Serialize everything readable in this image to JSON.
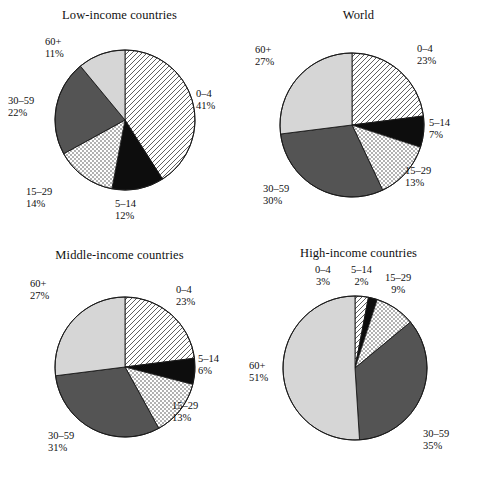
{
  "figure": {
    "background": "#ffffff",
    "panel_order": [
      "low",
      "world",
      "middle",
      "high"
    ]
  },
  "palette": {
    "hatch_stroke": "#4d4d4d",
    "hatch_bg": "#ffffff",
    "black": "#0d0d0d",
    "dotted_bg": "#ffffff",
    "dotted_dot": "#3d3d3d",
    "dark_gray": "#545454",
    "light_gray": "#d6d6d6",
    "outline": "#1a1a1a",
    "text": "#111111"
  },
  "categories": [
    "0–4",
    "5–14",
    "15–29",
    "30–59",
    "60+"
  ],
  "fills": [
    "hatch",
    "black",
    "dotted",
    "dark_gray",
    "light_gray"
  ],
  "chart_data": [
    {
      "type": "pie",
      "id": "low",
      "title": "Low-income countries",
      "categories": [
        "0–4",
        "5–14",
        "15–29",
        "30–59",
        "60+"
      ],
      "values": [
        41,
        12,
        14,
        22,
        11
      ],
      "labels": [
        "41%",
        "12%",
        "14%",
        "22%",
        "11%"
      ],
      "start_angle": 0,
      "direction": "clockwise",
      "center": [
        125,
        120
      ],
      "radius": 70
    },
    {
      "type": "pie",
      "id": "world",
      "title": "World",
      "categories": [
        "0–4",
        "5–14",
        "15–29",
        "30–59",
        "60+"
      ],
      "values": [
        23,
        7,
        13,
        30,
        27
      ],
      "labels": [
        "23%",
        "7%",
        "13%",
        "30%",
        "27%"
      ],
      "start_angle": 0,
      "direction": "clockwise",
      "center": [
        113,
        125
      ],
      "radius": 72
    },
    {
      "type": "pie",
      "id": "middle",
      "title": "Middle-income countries",
      "categories": [
        "0–4",
        "5–14",
        "15–29",
        "30–59",
        "60+"
      ],
      "values": [
        23,
        6,
        13,
        31,
        27
      ],
      "labels": [
        "23%",
        "6%",
        "13%",
        "31%",
        "27%"
      ],
      "start_angle": 0,
      "direction": "clockwise",
      "center": [
        125,
        127
      ],
      "radius": 70
    },
    {
      "type": "pie",
      "id": "high",
      "title": "High-income countries",
      "categories": [
        "0–4",
        "5–14",
        "15–29",
        "30–59",
        "60+"
      ],
      "values": [
        3,
        2,
        9,
        35,
        51
      ],
      "labels": [
        "3%",
        "2%",
        "9%",
        "35%",
        "51%"
      ],
      "start_angle": 0,
      "direction": "clockwise",
      "center": [
        116,
        128
      ],
      "radius": 72
    }
  ],
  "panels": {
    "low": {
      "title": "Low-income countries",
      "labels": [
        {
          "range": "0–4",
          "pct": "41%",
          "x": 196,
          "y": 88,
          "align": "left"
        },
        {
          "range": "5–14",
          "pct": "12%",
          "x": 115,
          "y": 198,
          "align": "left"
        },
        {
          "range": "15–29",
          "pct": "14%",
          "x": 26,
          "y": 186,
          "align": "left"
        },
        {
          "range": "30–59",
          "pct": "22%",
          "x": 8,
          "y": 95,
          "align": "left"
        },
        {
          "range": "60+",
          "pct": "11%",
          "x": 45,
          "y": 36,
          "align": "left"
        }
      ]
    },
    "world": {
      "title": "World",
      "labels": [
        {
          "range": "0–4",
          "pct": "23%",
          "x": 178,
          "y": 43,
          "align": "left"
        },
        {
          "range": "5–14",
          "pct": "7%",
          "x": 190,
          "y": 117,
          "align": "left"
        },
        {
          "range": "15–29",
          "pct": "13%",
          "x": 166,
          "y": 165,
          "align": "left"
        },
        {
          "range": "30–59",
          "pct": "30%",
          "x": 24,
          "y": 183,
          "align": "left"
        },
        {
          "range": "60+",
          "pct": "27%",
          "x": 16,
          "y": 44,
          "align": "left"
        }
      ]
    },
    "middle": {
      "title": "Middle-income countries",
      "labels": [
        {
          "range": "0–4",
          "pct": "23%",
          "x": 176,
          "y": 44,
          "align": "left"
        },
        {
          "range": "5–14",
          "pct": "6%",
          "x": 198,
          "y": 113,
          "align": "left"
        },
        {
          "range": "15–29",
          "pct": "13%",
          "x": 172,
          "y": 160,
          "align": "left"
        },
        {
          "range": "30–59",
          "pct": "31%",
          "x": 48,
          "y": 190,
          "align": "left"
        },
        {
          "range": "60+",
          "pct": "27%",
          "x": 30,
          "y": 38,
          "align": "left"
        }
      ]
    },
    "high": {
      "title": "High-income countries",
      "labels": [
        {
          "range": "0–4",
          "pct": "3%",
          "x": 76,
          "y": 24,
          "align": "center"
        },
        {
          "range": "5–14",
          "pct": "2%",
          "x": 112,
          "y": 24,
          "align": "center"
        },
        {
          "range": "15–29",
          "pct": "9%",
          "x": 146,
          "y": 32,
          "align": "center"
        },
        {
          "range": "30–59",
          "pct": "35%",
          "x": 184,
          "y": 188,
          "align": "left"
        },
        {
          "range": "60+",
          "pct": "51%",
          "x": 10,
          "y": 120,
          "align": "left"
        }
      ]
    }
  }
}
